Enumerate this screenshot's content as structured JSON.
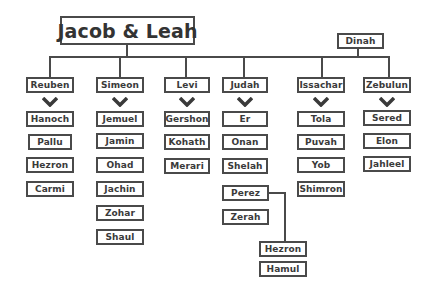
{
  "diagram": {
    "type": "family-tree",
    "root": {
      "label": "Jacob & Leah"
    },
    "daughter": {
      "label": "Dinah"
    },
    "sons": [
      {
        "label": "Reuben",
        "children": [
          "Hanoch",
          "Pallu",
          "Hezron",
          "Carmi"
        ]
      },
      {
        "label": "Simeon",
        "children": [
          "Jemuel",
          "Jamin",
          "Ohad",
          "Jachin",
          "Zohar",
          "Shaul"
        ]
      },
      {
        "label": "Levi",
        "children": [
          "Gershon",
          "Kohath",
          "Merari"
        ]
      },
      {
        "label": "Judah",
        "children": [
          "Er",
          "Onan",
          "Shelah",
          "Perez",
          "Zerah"
        ]
      },
      {
        "label": "Issachar",
        "children": [
          "Tola",
          "Puvah",
          "Yob",
          "Shimron"
        ]
      },
      {
        "label": "Zebulun",
        "children": [
          "Sered",
          "Elon",
          "Jahleel"
        ]
      }
    ],
    "grandchildren_of_perez": [
      "Hezron",
      "Hamul"
    ],
    "colors": {
      "line": "#4a4a4a",
      "text": "#3a3a3a",
      "background": "#ffffff"
    }
  }
}
